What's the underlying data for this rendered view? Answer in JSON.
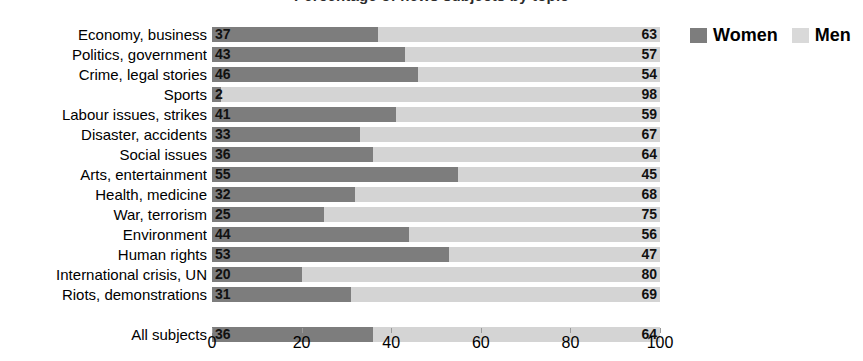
{
  "title": "Percentage of news subjects by topic",
  "legend": {
    "position": "top-right",
    "items": [
      {
        "label": "Women",
        "color": "#7d7d7d",
        "key": "women"
      },
      {
        "label": "Men",
        "color": "#d9d9d9",
        "key": "men"
      }
    ]
  },
  "axis": {
    "ticks": [
      0,
      20,
      40,
      60,
      80,
      100
    ],
    "min": 0,
    "max": 100,
    "xlabel": "",
    "ylabel": ""
  },
  "chart_data": {
    "type": "bar",
    "orientation": "horizontal",
    "stacked": true,
    "normalized_percent": true,
    "title": "Percentage of news subjects by topic",
    "xlabel": "",
    "ylabel": "",
    "xlim": [
      0,
      100
    ],
    "grid": false,
    "legend_position": "top-right",
    "categories": [
      "Economy, business",
      "Politics, government",
      "Crime, legal stories",
      "Sports",
      "Labour issues, strikes",
      "Disaster, accidents",
      "Social issues",
      "Arts, entertainment",
      "Health, medicine",
      "War, terrorism",
      "Environment",
      "Human rights",
      "International crisis, UN",
      "Riots, demonstrations"
    ],
    "series": [
      {
        "name": "Women",
        "color": "#7d7d7d",
        "values": [
          37,
          43,
          46,
          2,
          41,
          33,
          36,
          55,
          32,
          25,
          44,
          53,
          20,
          31
        ]
      },
      {
        "name": "Men",
        "color": "#d4d4d4",
        "values": [
          63,
          57,
          54,
          98,
          59,
          67,
          64,
          45,
          68,
          75,
          56,
          47,
          80,
          69
        ]
      }
    ],
    "total": {
      "category": "All subjects",
      "women": 36,
      "men": 64
    }
  }
}
